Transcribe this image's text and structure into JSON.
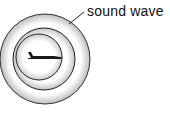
{
  "diagram": {
    "title": "",
    "labels": {
      "sound_wave": "sound wave"
    },
    "objects": {
      "aircraft": "airplane-silhouette",
      "wavefronts": 3
    },
    "colors": {
      "line": "#222222",
      "shade": "#c8c8c8",
      "background": "#ffffff"
    }
  }
}
